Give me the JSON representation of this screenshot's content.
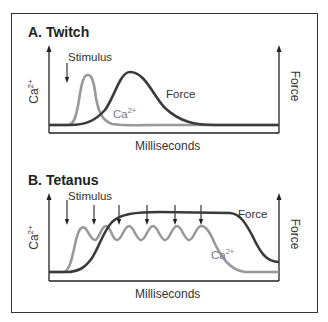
{
  "panels": [
    {
      "title": "A. Twitch",
      "stimulus_label": "Stimulus",
      "left_axis_label": "Ca",
      "left_axis_sup": "2+",
      "right_axis_label": "Force",
      "x_axis_label": "Milliseconds",
      "force_curve_label": "Force",
      "ca_curve_label": "Ca",
      "ca_curve_sup": "2+"
    },
    {
      "title": "B. Tetanus",
      "stimulus_label": "Stimulus",
      "left_axis_label": "Ca",
      "left_axis_sup": "2+",
      "right_axis_label": "Force",
      "x_axis_label": "Milliseconds",
      "force_curve_label": "Force",
      "ca_curve_label": "Ca",
      "ca_curve_sup": "2+"
    }
  ],
  "colors": {
    "force_curve": "#3a3a3a",
    "ca_curve": "#999999",
    "axis": "#222222",
    "frame": "#333333"
  }
}
